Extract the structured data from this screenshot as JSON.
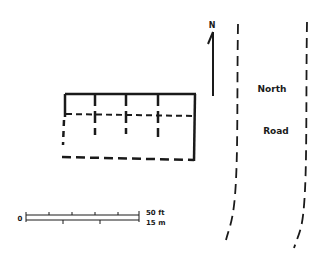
{
  "diagram": {
    "type": "site-plan",
    "north_arrow": {
      "label": "N"
    },
    "road": {
      "label_line1": "North",
      "label_line2": "Road"
    },
    "building": {
      "description": "rectangular structure with solid and dashed wall lines"
    },
    "scale_bar": {
      "zero_label": "0",
      "top_label": "50 ft",
      "bottom_label": "15 m"
    },
    "colors": {
      "ink": "#1a1a1a",
      "background": "#ffffff"
    }
  }
}
